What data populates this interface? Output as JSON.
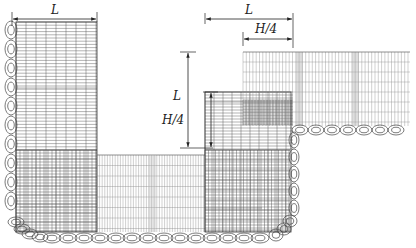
{
  "diagram": {
    "type": "mesh-layout-drawing",
    "colors": {
      "background": "#ffffff",
      "line": "#333333",
      "grid_dense": "#555555",
      "grid_light": "#888888"
    },
    "dimensions": [
      {
        "id": "top-left-width",
        "label": "L",
        "orientation": "horizontal"
      },
      {
        "id": "middle-height",
        "label": "L",
        "orientation": "vertical"
      },
      {
        "id": "middle-step-height",
        "label": "H/4",
        "orientation": "vertical"
      },
      {
        "id": "top-right-width",
        "label": "L",
        "orientation": "horizontal"
      },
      {
        "id": "top-right-step-width",
        "label": "H/4",
        "orientation": "horizontal"
      }
    ],
    "regions": [
      {
        "id": "left-column",
        "label": ""
      },
      {
        "id": "bottom-strip",
        "label": ""
      },
      {
        "id": "middle-column",
        "label": ""
      },
      {
        "id": "right-top-block",
        "label": ""
      }
    ]
  }
}
